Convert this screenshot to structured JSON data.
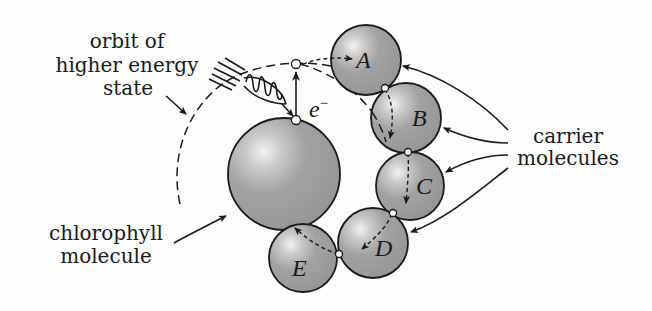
{
  "diagram": {
    "labels": {
      "orbit": [
        "orbit of",
        "higher energy",
        "state"
      ],
      "chlorophyll": [
        "chlorophyll",
        "molecule"
      ],
      "carrier": [
        "carrier",
        "molecules"
      ],
      "electron": "e",
      "electron_sup": "−"
    },
    "molecules": {
      "chlorophyll": {
        "cx": 284,
        "cy": 174,
        "r": 56
      },
      "carriers": [
        {
          "id": "A",
          "cx": 366,
          "cy": 60,
          "r": 35
        },
        {
          "id": "B",
          "cx": 406,
          "cy": 118,
          "r": 35
        },
        {
          "id": "C",
          "cx": 410,
          "cy": 186,
          "r": 34
        },
        {
          "id": "D",
          "cx": 373,
          "cy": 243,
          "r": 35
        },
        {
          "id": "E",
          "cx": 303,
          "cy": 258,
          "r": 34
        }
      ]
    },
    "colors": {
      "molecule_fill": "#9b9b9b",
      "highlight": "#f2f2f2",
      "ink": "#1a1a1a",
      "background": "#fdfdfd"
    }
  }
}
